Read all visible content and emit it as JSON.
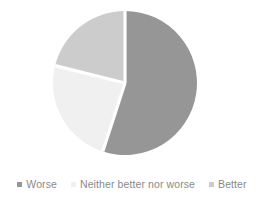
{
  "chart_data": {
    "type": "pie",
    "title": "",
    "subtitle": "",
    "xlabel": "",
    "ylabel": "",
    "grid": false,
    "legend_position": "bottom",
    "start_angle_deg": 0,
    "direction": "clockwise",
    "categories": [
      "Worse",
      "Neither better nor worse",
      "Better"
    ],
    "values": [
      55,
      24,
      21
    ],
    "slices": [
      {
        "label": "Worse",
        "value": 55,
        "color": "#969696",
        "start_angle_deg": 0,
        "end_angle_deg": 198
      },
      {
        "label": "Neither better nor worse",
        "value": 24,
        "color": "#f0f0f0",
        "start_angle_deg": 198,
        "end_angle_deg": 284
      },
      {
        "label": "Better",
        "value": 21,
        "color": "#cccccc",
        "start_angle_deg": 284,
        "end_angle_deg": 360
      }
    ]
  },
  "legend": {
    "items": [
      {
        "label": "Worse",
        "marker": "square-marker",
        "color": "#969696"
      },
      {
        "label": "Neither better nor worse",
        "marker": "square-marker",
        "color": "#f0f0f0"
      },
      {
        "label": "Better",
        "marker": "square-marker",
        "color": "#cccccc"
      }
    ]
  },
  "colors": {
    "background": "#ffffff",
    "slice_worse": "#969696",
    "slice_neither": "#f0f0f0",
    "slice_better": "#cccccc",
    "slice_divider": "#ffffff",
    "legend_text": "#8a8a8a"
  }
}
